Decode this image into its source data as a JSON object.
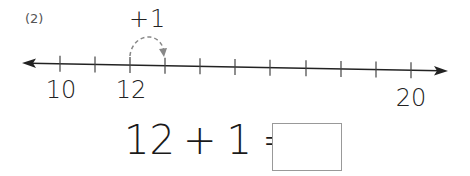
{
  "problem": {
    "number_label": "(2)",
    "jump_label": "+1",
    "equation": {
      "operand_a": "12",
      "operator": "+",
      "operand_b": "1",
      "equals": "=",
      "answer": ""
    }
  },
  "number_line": {
    "start": 10,
    "end": 20,
    "step": 1,
    "tick_positions_x": [
      60,
      95,
      130,
      165,
      200,
      235,
      270,
      306,
      341,
      376,
      411
    ],
    "labels": [
      {
        "value": "10",
        "x": 61,
        "y": 76
      },
      {
        "value": "12",
        "x": 131,
        "y": 76
      },
      {
        "value": "20",
        "x": 411,
        "y": 84
      }
    ],
    "jump": {
      "from": 12,
      "to": 13
    },
    "line_color": "#222222",
    "jump_arc_color": "#888888"
  }
}
